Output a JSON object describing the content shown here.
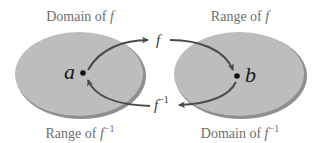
{
  "diagram": {
    "labels": {
      "top_left_prefix": "Domain of ",
      "top_left_fn": "f",
      "top_right_prefix": "Range of ",
      "top_right_fn": "f",
      "bottom_left_prefix": "Range of ",
      "bottom_left_fn": "f",
      "bottom_left_sup": "−1",
      "bottom_right_prefix": "Domain of ",
      "bottom_right_fn": "f",
      "bottom_right_sup": "−1"
    },
    "points": {
      "left": "a",
      "right": "b"
    },
    "arrows": {
      "forward_fn": "f",
      "inverse_fn": "f",
      "inverse_sup": "−1"
    },
    "colors": {
      "ellipse_fill": "#bdbdbd",
      "ellipse_shadow": "#8f8f8f",
      "arrow": "#4a4a4a",
      "label_text": "#6e6e6e"
    }
  }
}
